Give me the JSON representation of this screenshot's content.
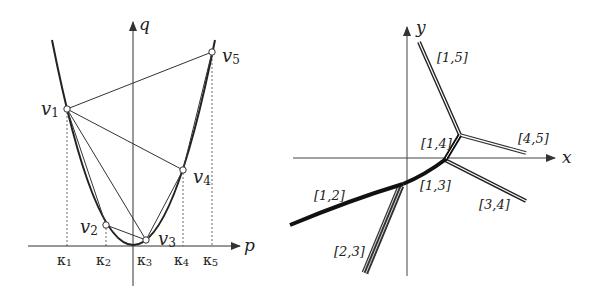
{
  "left_diagram": {
    "axes": {
      "horizontal_label": "p",
      "vertical_label": "q"
    },
    "points": [
      {
        "id": "v1",
        "label": "v",
        "sub": "1",
        "x": 67,
        "y": 109
      },
      {
        "id": "v2",
        "label": "v",
        "sub": "2",
        "x": 106,
        "y": 225
      },
      {
        "id": "v3",
        "label": "v",
        "sub": "3",
        "x": 146,
        "y": 240
      },
      {
        "id": "v4",
        "label": "v",
        "sub": "4",
        "x": 183,
        "y": 170
      },
      {
        "id": "v5",
        "label": "v",
        "sub": "5",
        "x": 212,
        "y": 52
      }
    ],
    "ticks": [
      {
        "label": "κ",
        "sub": "1"
      },
      {
        "label": "κ",
        "sub": "2"
      },
      {
        "label": "κ",
        "sub": "3"
      },
      {
        "label": "κ",
        "sub": "4"
      },
      {
        "label": "κ",
        "sub": "5"
      }
    ],
    "edges": [
      "v1-v5",
      "v1-v4",
      "v1-v3",
      "v1-v2",
      "v2-v3",
      "v3-v4",
      "v4-v5"
    ]
  },
  "right_diagram": {
    "axes": {
      "horizontal_label": "x",
      "vertical_label": "y"
    },
    "edges": [
      {
        "id": "e15",
        "label": "[1,5]"
      },
      {
        "id": "e14",
        "label": "[1,4]"
      },
      {
        "id": "e45",
        "label": "[4,5]"
      },
      {
        "id": "e13",
        "label": "[1,3]"
      },
      {
        "id": "e34",
        "label": "[3,4]"
      },
      {
        "id": "e12",
        "label": "[1,2]"
      },
      {
        "id": "e23",
        "label": "[2,3]"
      }
    ]
  }
}
